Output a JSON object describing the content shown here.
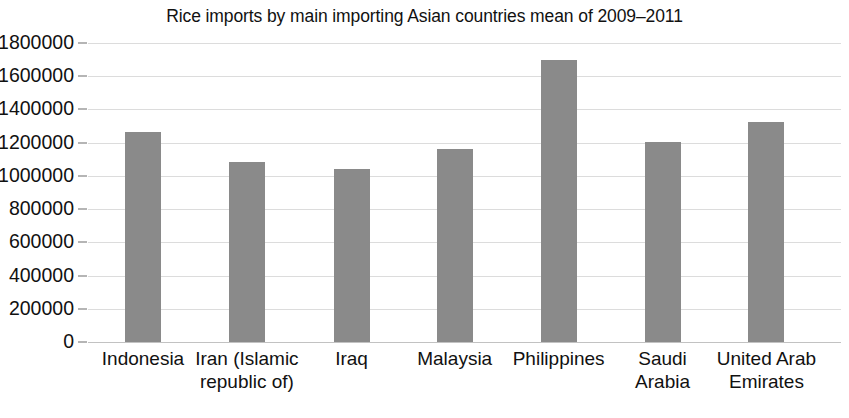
{
  "chart_data": {
    "type": "bar",
    "title": "Rice imports by main importing Asian countries mean of 2009–2011",
    "xlabel": "",
    "ylabel": "",
    "categories": [
      "Indonesia",
      "Iran (Islamic republic of)",
      "Iraq",
      "Malaysia",
      "Philippines",
      "Saudi Arabia",
      "United Arab Emirates"
    ],
    "category_lines": [
      [
        "Indonesia"
      ],
      [
        "Iran (Islamic",
        "republic of)"
      ],
      [
        "Iraq"
      ],
      [
        "Malaysia"
      ],
      [
        "Philippines"
      ],
      [
        "Saudi",
        "Arabia"
      ],
      [
        "United Arab",
        "Emirates"
      ]
    ],
    "values": [
      1265000,
      1085000,
      1040000,
      1160000,
      1695000,
      1205000,
      1325000
    ],
    "ylim": [
      0,
      1800000
    ],
    "ytick_values": [
      0,
      200000,
      400000,
      600000,
      800000,
      1000000,
      1200000,
      1400000,
      1600000,
      1800000
    ],
    "ytick_labels": [
      "0",
      "200000",
      "400000",
      "600000",
      "800000",
      "1000000",
      "1200000",
      "1400000",
      "1600000",
      "1800000"
    ],
    "grid": true,
    "legend": null,
    "bar_color": "#8a8a8a",
    "grid_color": "#dcdcdc",
    "axis_color": "#6d6d6d",
    "background_color": "#ffffff",
    "bar_geometry": [
      {
        "center_pct": 7.3,
        "width_px": 36
      },
      {
        "center_pct": 21.1,
        "width_px": 36
      },
      {
        "center_pct": 35.0,
        "width_px": 36
      },
      {
        "center_pct": 48.7,
        "width_px": 36
      },
      {
        "center_pct": 62.5,
        "width_px": 36
      },
      {
        "center_pct": 76.3,
        "width_px": 36
      },
      {
        "center_pct": 90.1,
        "width_px": 36
      }
    ]
  }
}
